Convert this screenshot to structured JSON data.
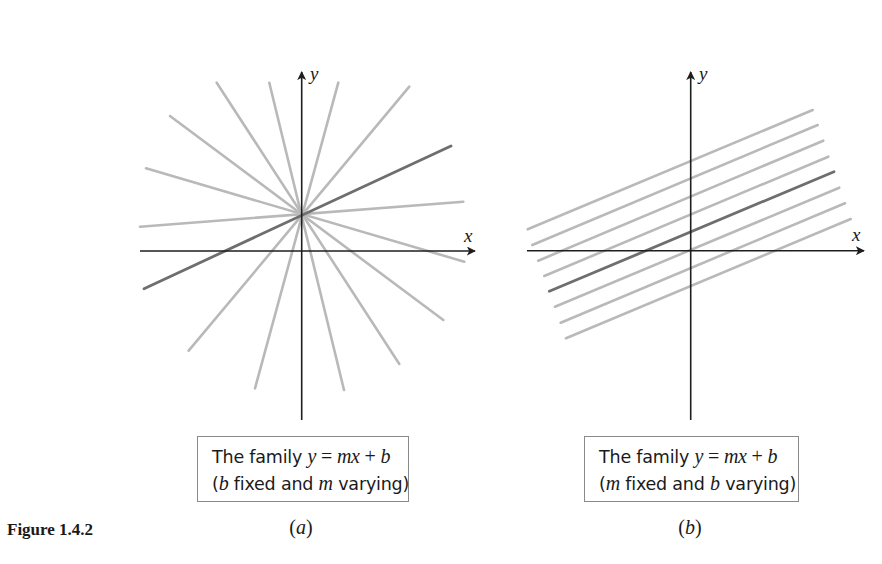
{
  "figure": {
    "number_label": "Figure 1.4.2"
  },
  "colors": {
    "axis": "#1e1e1e",
    "family_line": "#b9b9b9",
    "highlight_line": "#6e6e6e",
    "caption_border": "#8a8a8a",
    "text": "#1a1a1a"
  },
  "panels": [
    {
      "id": "a",
      "label_open": "(",
      "label_letter": "a",
      "label_close": ")",
      "x_axis_label": "x",
      "y_axis_label": "y",
      "caption": {
        "line1_text": "The family ",
        "line1_y": "y",
        "line1_eq": " = ",
        "line1_mx": "mx",
        "line1_plus": " + ",
        "line1_b": "b",
        "line2_open": "(",
        "line2_var1": "b",
        "line2_mid": " fixed and ",
        "line2_var2": "m",
        "line2_end": " varying)"
      },
      "description": "Lines through a common point (fixed intercept b) with varying slope m",
      "line_count": 8,
      "highlighted_line_index": 5
    },
    {
      "id": "b",
      "label_open": "(",
      "label_letter": "b",
      "label_close": ")",
      "x_axis_label": "x",
      "y_axis_label": "y",
      "caption": {
        "line1_text": "The family ",
        "line1_y": "y",
        "line1_eq": " = ",
        "line1_mx": "mx",
        "line1_plus": " + ",
        "line1_b": "b",
        "line2_open": "(",
        "line2_var1": "m",
        "line2_mid": " fixed and ",
        "line2_var2": "b",
        "line2_end": " varying)"
      },
      "description": "Parallel lines (fixed slope m) with varying intercept b",
      "line_count": 8,
      "highlighted_line_index": 4
    }
  ]
}
